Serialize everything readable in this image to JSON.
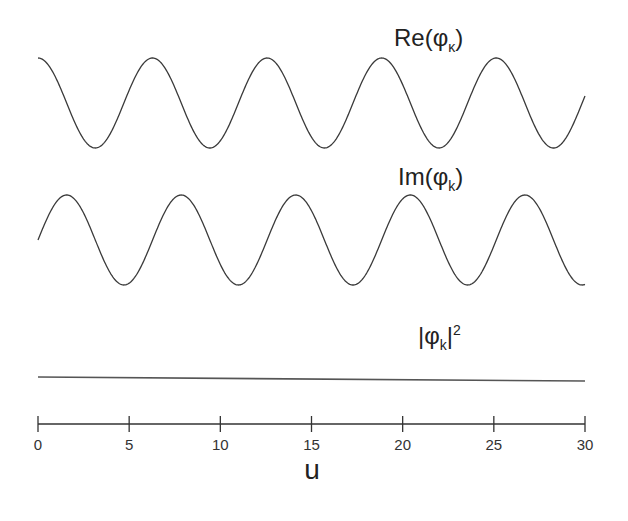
{
  "chart_data": {
    "type": "line",
    "title": "",
    "xlabel": "u",
    "ylabel": "",
    "xlim": [
      0,
      30
    ],
    "x_ticks": [
      0,
      5,
      10,
      15,
      20,
      25,
      30
    ],
    "x_tick_labels": [
      "0",
      "5",
      "10",
      "15",
      "20",
      "25",
      "30"
    ],
    "grid": false,
    "legend": "none (inline curve labels)",
    "series": [
      {
        "name": "Re(φκ)",
        "function": "cos(u)",
        "amplitude": 1,
        "period": 6.283,
        "offset_panel": "top"
      },
      {
        "name": "Im(φk)",
        "function": "sin(u)",
        "amplitude": 1,
        "period": 6.283,
        "offset_panel": "middle"
      },
      {
        "name": "|φk|^2",
        "function": "1 (constant)",
        "value": 1,
        "offset_panel": "bottom"
      }
    ]
  },
  "labels": {
    "re": {
      "prefix": "Re(φ",
      "sub": "κ",
      "suffix": ")"
    },
    "im": {
      "prefix": "Im(φ",
      "sub": "k",
      "suffix": ")"
    },
    "abs": {
      "prefix": "|φ",
      "sub": "k",
      "mid": "|",
      "sup": "2"
    }
  },
  "style": {
    "line_color": "#3a3a3a",
    "axis_color": "#333333"
  }
}
